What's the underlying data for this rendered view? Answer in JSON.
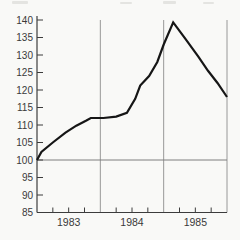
{
  "chart_data": {
    "type": "line",
    "x": [
      1983.0,
      1983.07,
      1983.25,
      1983.45,
      1983.62,
      1983.78,
      1983.85,
      1984.05,
      1984.25,
      1984.42,
      1984.55,
      1984.63,
      1984.77,
      1984.9,
      1985.0,
      1985.15,
      1985.35,
      1985.55,
      1985.7,
      1985.85,
      1986.0
    ],
    "series": [
      {
        "name": "index-line",
        "values": [
          100,
          102.3,
          105,
          107.8,
          109.8,
          111.3,
          112,
          112,
          112.4,
          113.5,
          117.5,
          121.3,
          124,
          128,
          133,
          139.3,
          134.5,
          129.5,
          125.5,
          122,
          118
        ]
      }
    ],
    "x_axis": {
      "range": [
        1983,
        1986
      ],
      "year_labels": [
        "1983",
        "1984",
        "1985"
      ],
      "quarter_tick_interval": 0.25
    },
    "y_axis": {
      "range": [
        85,
        140
      ],
      "ticks": [
        85,
        90,
        95,
        100,
        105,
        110,
        115,
        120,
        125,
        130,
        135,
        140
      ]
    },
    "gridlines": {
      "vertical_years": [
        1984,
        1985,
        1986
      ],
      "horizontal_reference": 100
    },
    "legend": "none",
    "colors": {
      "line": "#161616",
      "axis": "#3c3c3c",
      "grid": "#8d8d8d",
      "reference": "#7f7f7f",
      "label": "#3a3a3a",
      "background": "#f9f9f7"
    }
  }
}
